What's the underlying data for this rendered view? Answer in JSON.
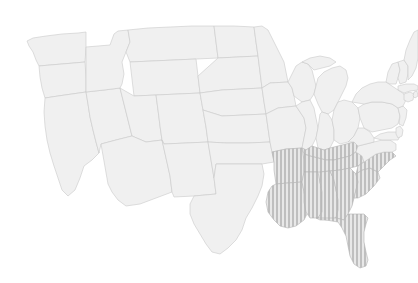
{
  "map": {
    "title": "",
    "region": "United States",
    "projection": "albers-usa",
    "background_color": "#ffffff",
    "base_fill_color": "#f0f0f0",
    "border_color": "#c9c9c9",
    "highlight_fill_color": "#c4c4c4",
    "highlight_border_color": "#b4b4b4",
    "highlight_pattern": "vertical-stripes",
    "highlight_pattern_stripe_width_px": 2,
    "highlight_pattern_gap_px": 2,
    "legend": null,
    "labels_visible": false,
    "highlighted_region_name": "Southeast",
    "highlighted_states": [
      "Arkansas",
      "Louisiana",
      "Mississippi",
      "Alabama",
      "Tennessee",
      "Kentucky",
      "Georgia",
      "Florida",
      "South Carolina",
      "North Carolina"
    ],
    "states": [
      {
        "id": "WA",
        "name": "Washington",
        "highlighted": false
      },
      {
        "id": "OR",
        "name": "Oregon",
        "highlighted": false
      },
      {
        "id": "CA",
        "name": "California",
        "highlighted": false
      },
      {
        "id": "NV",
        "name": "Nevada",
        "highlighted": false
      },
      {
        "id": "ID",
        "name": "Idaho",
        "highlighted": false
      },
      {
        "id": "MT",
        "name": "Montana",
        "highlighted": false
      },
      {
        "id": "WY",
        "name": "Wyoming",
        "highlighted": false
      },
      {
        "id": "UT",
        "name": "Utah",
        "highlighted": false
      },
      {
        "id": "AZ",
        "name": "Arizona",
        "highlighted": false
      },
      {
        "id": "CO",
        "name": "Colorado",
        "highlighted": false
      },
      {
        "id": "NM",
        "name": "New Mexico",
        "highlighted": false
      },
      {
        "id": "ND",
        "name": "North Dakota",
        "highlighted": false
      },
      {
        "id": "SD",
        "name": "South Dakota",
        "highlighted": false
      },
      {
        "id": "NE",
        "name": "Nebraska",
        "highlighted": false
      },
      {
        "id": "KS",
        "name": "Kansas",
        "highlighted": false
      },
      {
        "id": "OK",
        "name": "Oklahoma",
        "highlighted": false
      },
      {
        "id": "TX",
        "name": "Texas",
        "highlighted": false
      },
      {
        "id": "MN",
        "name": "Minnesota",
        "highlighted": false
      },
      {
        "id": "IA",
        "name": "Iowa",
        "highlighted": false
      },
      {
        "id": "MO",
        "name": "Missouri",
        "highlighted": false
      },
      {
        "id": "AR",
        "name": "Arkansas",
        "highlighted": true
      },
      {
        "id": "LA",
        "name": "Louisiana",
        "highlighted": true
      },
      {
        "id": "WI",
        "name": "Wisconsin",
        "highlighted": false
      },
      {
        "id": "IL",
        "name": "Illinois",
        "highlighted": false
      },
      {
        "id": "MI",
        "name": "Michigan",
        "highlighted": false
      },
      {
        "id": "IN",
        "name": "Indiana",
        "highlighted": false
      },
      {
        "id": "OH",
        "name": "Ohio",
        "highlighted": false
      },
      {
        "id": "KY",
        "name": "Kentucky",
        "highlighted": true
      },
      {
        "id": "TN",
        "name": "Tennessee",
        "highlighted": true
      },
      {
        "id": "MS",
        "name": "Mississippi",
        "highlighted": true
      },
      {
        "id": "AL",
        "name": "Alabama",
        "highlighted": true
      },
      {
        "id": "GA",
        "name": "Georgia",
        "highlighted": true
      },
      {
        "id": "FL",
        "name": "Florida",
        "highlighted": true
      },
      {
        "id": "SC",
        "name": "South Carolina",
        "highlighted": true
      },
      {
        "id": "NC",
        "name": "North Carolina",
        "highlighted": true
      },
      {
        "id": "VA",
        "name": "Virginia",
        "highlighted": false
      },
      {
        "id": "WV",
        "name": "West Virginia",
        "highlighted": false
      },
      {
        "id": "MD",
        "name": "Maryland",
        "highlighted": false
      },
      {
        "id": "DE",
        "name": "Delaware",
        "highlighted": false
      },
      {
        "id": "PA",
        "name": "Pennsylvania",
        "highlighted": false
      },
      {
        "id": "NJ",
        "name": "New Jersey",
        "highlighted": false
      },
      {
        "id": "NY",
        "name": "New York",
        "highlighted": false
      },
      {
        "id": "CT",
        "name": "Connecticut",
        "highlighted": false
      },
      {
        "id": "RI",
        "name": "Rhode Island",
        "highlighted": false
      },
      {
        "id": "MA",
        "name": "Massachusetts",
        "highlighted": false
      },
      {
        "id": "VT",
        "name": "Vermont",
        "highlighted": false
      },
      {
        "id": "NH",
        "name": "New Hampshire",
        "highlighted": false
      },
      {
        "id": "ME",
        "name": "Maine",
        "highlighted": false
      }
    ]
  }
}
